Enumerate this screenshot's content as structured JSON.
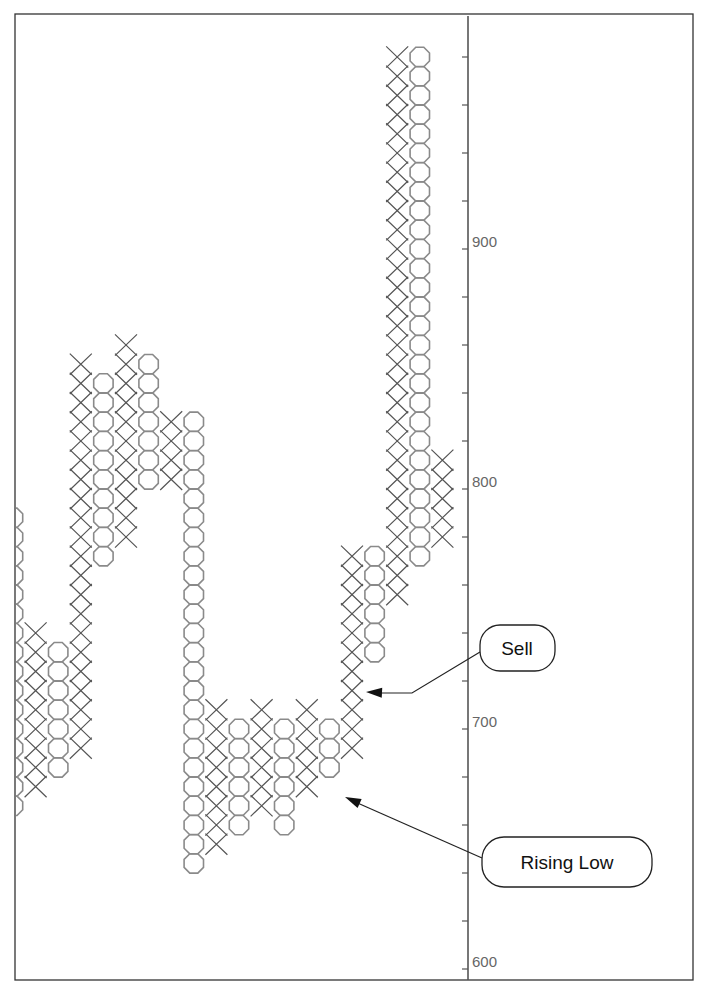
{
  "chart_data": {
    "type": "point-and-figure",
    "title": "",
    "xlabel": "",
    "ylabel": "",
    "box_size": 8,
    "ylim": [
      596,
      996
    ],
    "y_ticks": [
      600,
      700,
      800,
      900
    ],
    "y_tick_labels": [
      "600",
      "700",
      "800",
      "900"
    ],
    "minor_tick_step": 20,
    "axis_side": "right",
    "grid": false,
    "columns": [
      {
        "type": "O",
        "low": 664,
        "high": 784
      },
      {
        "type": "X",
        "low": 672,
        "high": 736
      },
      {
        "type": "O",
        "low": 680,
        "high": 728
      },
      {
        "type": "X",
        "low": 688,
        "high": 848
      },
      {
        "type": "O",
        "low": 768,
        "high": 840
      },
      {
        "type": "X",
        "low": 776,
        "high": 856
      },
      {
        "type": "O",
        "low": 800,
        "high": 848
      },
      {
        "type": "X",
        "low": 800,
        "high": 824
      },
      {
        "type": "O",
        "low": 640,
        "high": 824
      },
      {
        "type": "X",
        "low": 648,
        "high": 704
      },
      {
        "type": "O",
        "low": 656,
        "high": 696
      },
      {
        "type": "X",
        "low": 664,
        "high": 704
      },
      {
        "type": "O",
        "low": 656,
        "high": 696
      },
      {
        "type": "X",
        "low": 672,
        "high": 704
      },
      {
        "type": "O",
        "low": 680,
        "high": 696
      },
      {
        "type": "X",
        "low": 688,
        "high": 768
      },
      {
        "type": "O",
        "low": 728,
        "high": 768
      },
      {
        "type": "X",
        "low": 752,
        "high": 976
      },
      {
        "type": "O",
        "low": 768,
        "high": 976
      },
      {
        "type": "X",
        "low": 776,
        "high": 808
      }
    ],
    "annotations": [
      {
        "label": "Sell",
        "target_column": 15,
        "target_value": 712
      },
      {
        "label": "Rising Low",
        "target_column": 14,
        "target_value": 680
      }
    ]
  }
}
